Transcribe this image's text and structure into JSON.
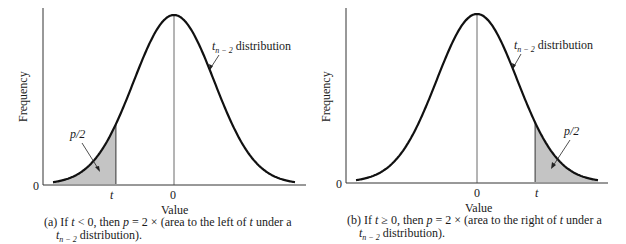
{
  "chart_data": [
    {
      "type": "area",
      "id": "a",
      "title": "",
      "xlabel": "Value",
      "ylabel": "Frequency",
      "distribution_label": "t_{n-2} distribution",
      "y_tick_labels": [
        "0"
      ],
      "x_tick_labels": [
        "t",
        "0"
      ],
      "shaded_region": "left of t",
      "shaded_label": "p/2",
      "t_position": -1.2,
      "caption_prefix": "(a) If",
      "caption_cond": "t < 0, then",
      "caption_p": "p",
      "caption_rest": "= 2 × (area to the left of",
      "caption_t": "t",
      "caption_end": "under a",
      "caption_line2_sub": "n − 2",
      "caption_line2": "distribution).",
      "grid": false
    },
    {
      "type": "area",
      "id": "b",
      "title": "",
      "xlabel": "Value",
      "ylabel": "Frequency",
      "distribution_label": "t_{n-2} distribution",
      "y_tick_labels": [
        "0"
      ],
      "x_tick_labels": [
        "0",
        "t"
      ],
      "shaded_region": "right of t",
      "shaded_label": "p/2",
      "t_position": 1.2,
      "caption_prefix": "(b) If",
      "caption_cond": "t ≥ 0, then",
      "caption_p": "p",
      "caption_rest": "= 2 × (area to the right of",
      "caption_t": "t",
      "caption_end": "under a",
      "caption_line2_sub": "n − 2",
      "caption_line2": "distribution).",
      "grid": false
    }
  ],
  "labels": {
    "xlabel": "Value",
    "ylabel": "Frequency",
    "zero": "0",
    "t": "t",
    "p2": "p/2",
    "dist_t": "t",
    "dist_sub": "n − 2",
    "dist_word": "distribution"
  },
  "colors": {
    "curve": "#111111",
    "shade": "#c4c4c4",
    "axis": "#333333"
  }
}
